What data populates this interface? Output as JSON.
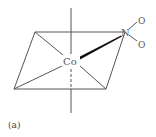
{
  "figure": {
    "caption": "(a)",
    "colors": {
      "line": "#555555",
      "wedge": "#111111",
      "background": "#ffffff"
    }
  },
  "atoms": {
    "center": "Co",
    "ligand_atom": "N",
    "oxygen_top": "O",
    "oxygen_bottom": "O"
  },
  "geometry": {
    "equatorial_plane": [
      [
        35,
        32
      ],
      [
        125,
        32
      ],
      [
        106,
        89
      ],
      [
        14,
        89
      ]
    ],
    "axis": {
      "x": 71,
      "y_top": 8,
      "y_bottom": 113,
      "dashed_from": 69,
      "dashed_to": 89
    },
    "wedge_bond": {
      "from": [
        80,
        58
      ],
      "to": [
        122,
        36
      ]
    }
  }
}
